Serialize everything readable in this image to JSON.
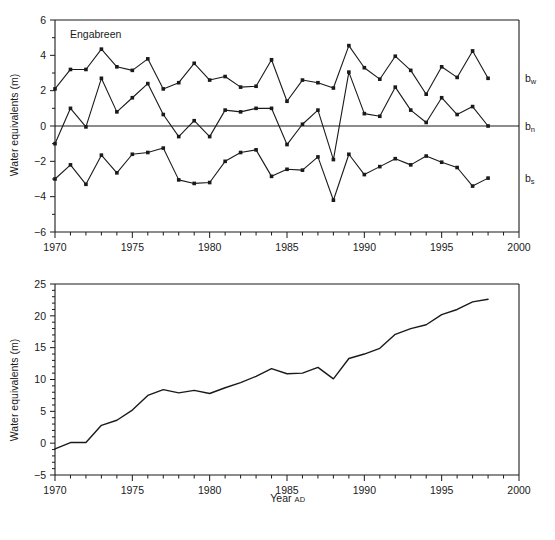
{
  "figure": {
    "annotation": "Engabreen",
    "xlabel_main": "Year",
    "xlabel_suffix": "AD",
    "ylabel": "Water equivalents (m)",
    "ink_color": "#1a1a1a",
    "background_color": "#ffffff"
  },
  "chart_data": [
    {
      "type": "line",
      "id": "seasonal-balance",
      "title": "Engabreen",
      "xlabel": "",
      "ylabel": "Water equivalents (m)",
      "xlim": [
        1970,
        2000
      ],
      "ylim": [
        -6,
        6
      ],
      "xticks": [
        1970,
        1975,
        1980,
        1985,
        1990,
        1995,
        2000
      ],
      "xticklabels": [
        "1970",
        "1975",
        "1980",
        "1985",
        "1990",
        "1995",
        "2000"
      ],
      "xminorticks": [
        1971,
        1972,
        1973,
        1974,
        1976,
        1977,
        1978,
        1979,
        1981,
        1982,
        1983,
        1984,
        1986,
        1987,
        1988,
        1989,
        1991,
        1992,
        1993,
        1994,
        1996,
        1997,
        1998,
        1999
      ],
      "yticks": [
        -6,
        -4,
        -2,
        0,
        2,
        4,
        6
      ],
      "yticklabels": [
        "-6",
        "-4",
        "-2",
        "0",
        "2",
        "4",
        "6"
      ],
      "grid": false,
      "zero_line": true,
      "markers": "filled-square",
      "legend_position": "right-inline",
      "x": [
        1970,
        1971,
        1972,
        1973,
        1974,
        1975,
        1976,
        1977,
        1978,
        1979,
        1980,
        1981,
        1982,
        1983,
        1984,
        1985,
        1986,
        1987,
        1988,
        1989,
        1990,
        1991,
        1992,
        1993,
        1994,
        1995,
        1996,
        1997,
        1998
      ],
      "series": [
        {
          "name": "b_w",
          "label": "b",
          "label_sub": "w",
          "description": "winter balance",
          "values": [
            2.1,
            3.2,
            3.2,
            4.35,
            3.35,
            3.15,
            3.8,
            2.1,
            2.45,
            3.55,
            2.6,
            2.8,
            2.2,
            2.25,
            3.75,
            1.4,
            2.6,
            2.45,
            2.15,
            4.55,
            3.3,
            2.65,
            3.95,
            3.15,
            1.8,
            3.35,
            2.75,
            4.25,
            2.7
          ]
        },
        {
          "name": "b_n",
          "label": "b",
          "label_sub": "n",
          "description": "net balance",
          "values": [
            -1.0,
            1.0,
            -0.05,
            2.7,
            0.8,
            1.6,
            2.4,
            0.65,
            -0.6,
            0.3,
            -0.6,
            0.9,
            0.8,
            1.0,
            1.0,
            -1.05,
            0.1,
            0.9,
            -1.9,
            3.05,
            0.7,
            0.55,
            2.2,
            0.9,
            0.2,
            1.6,
            0.65,
            1.1,
            0.0
          ]
        },
        {
          "name": "b_s",
          "label": "b",
          "label_sub": "s",
          "description": "summer balance",
          "values": [
            -3.0,
            -2.2,
            -3.3,
            -1.65,
            -2.65,
            -1.6,
            -1.5,
            -1.25,
            -3.05,
            -3.25,
            -3.2,
            -2.0,
            -1.5,
            -1.35,
            -2.85,
            -2.45,
            -2.5,
            -1.75,
            -4.2,
            -1.6,
            -2.75,
            -2.3,
            -1.85,
            -2.2,
            -1.7,
            -2.05,
            -2.35,
            -3.4,
            -2.95
          ]
        }
      ]
    },
    {
      "type": "line",
      "id": "cumulative-balance",
      "title": "",
      "xlabel": "Year AD",
      "ylabel": "Water equivalents (m)",
      "xlim": [
        1970,
        2000
      ],
      "ylim": [
        -5,
        25
      ],
      "xticks": [
        1970,
        1975,
        1980,
        1985,
        1990,
        1995,
        2000
      ],
      "xticklabels": [
        "1970",
        "1975",
        "1980",
        "1985",
        "1990",
        "1995",
        "2000"
      ],
      "xminorticks": [
        1971,
        1972,
        1973,
        1974,
        1976,
        1977,
        1978,
        1979,
        1981,
        1982,
        1983,
        1984,
        1986,
        1987,
        1988,
        1989,
        1991,
        1992,
        1993,
        1994,
        1996,
        1997,
        1998,
        1999
      ],
      "yticks": [
        -5,
        0,
        5,
        10,
        15,
        20,
        25
      ],
      "yticklabels": [
        "-5",
        "0",
        "5",
        "10",
        "15",
        "20",
        "25"
      ],
      "grid": false,
      "markers": "none",
      "x": [
        1970,
        1971,
        1972,
        1973,
        1974,
        1975,
        1976,
        1977,
        1978,
        1979,
        1980,
        1981,
        1982,
        1983,
        1984,
        1985,
        1986,
        1987,
        1988,
        1989,
        1990,
        1991,
        1992,
        1993,
        1994,
        1995,
        1996,
        1997,
        1998
      ],
      "series": [
        {
          "name": "cumulative_net_balance",
          "values": [
            -0.9,
            0.1,
            0.1,
            2.8,
            3.6,
            5.2,
            7.5,
            8.4,
            7.9,
            8.3,
            7.8,
            8.7,
            9.5,
            10.5,
            11.7,
            10.9,
            11.0,
            11.9,
            10.1,
            13.3,
            14.0,
            14.9,
            17.1,
            18.0,
            18.6,
            20.2,
            21.0,
            22.2,
            22.6
          ]
        }
      ]
    }
  ]
}
